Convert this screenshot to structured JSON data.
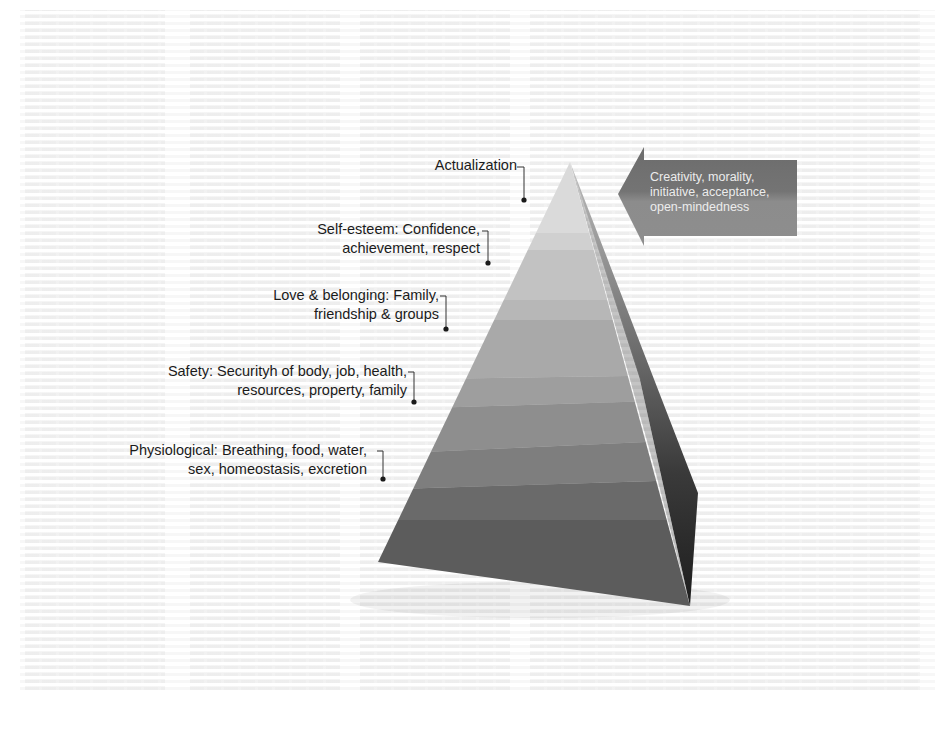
{
  "diagram": {
    "type": "pyramid",
    "levels": [
      {
        "name": "actualization",
        "title": "Actualization",
        "lines": [
          "Actualization"
        ],
        "color": "#d8d8d8"
      },
      {
        "name": "self-esteem",
        "title": "Self-esteem",
        "lines": [
          "Self-esteem: Confidence,",
          "achievement, respect"
        ],
        "color": "#c4c4c4"
      },
      {
        "name": "love-belonging",
        "title": "Love & belonging",
        "lines": [
          "Love & belonging: Family,",
          "friendship & groups"
        ],
        "color": "#adadad"
      },
      {
        "name": "safety",
        "title": "Safety",
        "lines": [
          "Safety: Securityh of body, job, health,",
          "resources, property, family"
        ],
        "color": "#8f8f8f"
      },
      {
        "name": "physiological",
        "title": "Physiological",
        "lines": [
          "Physiological: Breathing, food, water,",
          "sex, homeostasis, excretion"
        ],
        "color": "#5f5f5f"
      }
    ],
    "callout_arrow": {
      "lines": [
        "Creativity, morality,",
        "initiative, acceptance,",
        "open-mindedness"
      ],
      "color_top": "#6e6e6e",
      "color_bottom": "#8a8a8a"
    },
    "colors": {
      "label_text": "#1b1b1b",
      "leader_line": "#333333",
      "side_face_dark": "#2a2a2a",
      "side_face_mid": "#4a4a4a"
    }
  }
}
